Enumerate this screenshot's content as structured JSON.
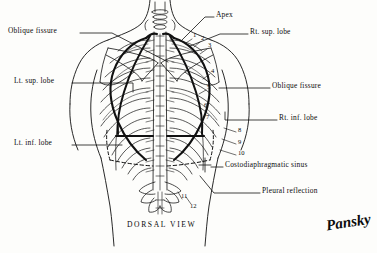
{
  "figure": {
    "caption": "DORSAL VIEW",
    "signature": "Pansky",
    "ink_color": "#0b0b0b",
    "background_color": "#fdfdfb"
  },
  "labels_left": [
    {
      "text": "Oblique fissure",
      "x": 8,
      "y": 30,
      "leader_to_x": 168,
      "leader_to_y": 62
    },
    {
      "text": "Lt. sup. lobe",
      "x": 14,
      "y": 80,
      "leader_to_x": 133,
      "leader_to_y": 88
    },
    {
      "text": "Lt. inf. lobe",
      "x": 14,
      "y": 142,
      "leader_to_x": 122,
      "leader_to_y": 146
    }
  ],
  "labels_right": [
    {
      "text": "Apex",
      "x": 216,
      "y": 14,
      "leader_to_x": 182,
      "leader_to_y": 40
    },
    {
      "text": "Rt. sup. lobe",
      "x": 250,
      "y": 31,
      "leader_to_x": 199,
      "leader_to_y": 46
    },
    {
      "text": "Oblique fissure",
      "x": 272,
      "y": 85,
      "leader_to_x": 219,
      "leader_to_y": 88
    },
    {
      "text": "Rt. inf. lobe",
      "x": 279,
      "y": 117,
      "leader_to_x": 224,
      "leader_to_y": 121
    },
    {
      "text": "Costodiaphragmatic sinus",
      "x": 225,
      "y": 164,
      "leader_to_x": 213,
      "leader_to_y": 165
    },
    {
      "text": "Pleural reflection",
      "x": 262,
      "y": 190,
      "leader_to_x": 205,
      "leader_to_y": 178
    }
  ],
  "rib_numbers": [
    {
      "n": "1",
      "x": 193,
      "y": 35
    },
    {
      "n": "2",
      "x": 201,
      "y": 38
    },
    {
      "n": "3",
      "x": 208,
      "y": 45
    },
    {
      "n": "4",
      "x": 211,
      "y": 71
    },
    {
      "n": "5",
      "x": 207,
      "y": 87
    },
    {
      "n": "6",
      "x": 204,
      "y": 105
    },
    {
      "n": "7",
      "x": 206,
      "y": 117
    },
    {
      "n": "8",
      "x": 238,
      "y": 130
    },
    {
      "n": "9",
      "x": 238,
      "y": 142
    },
    {
      "n": "10",
      "x": 238,
      "y": 153
    },
    {
      "n": "11",
      "x": 181,
      "y": 196
    },
    {
      "n": "12",
      "x": 190,
      "y": 206
    }
  ],
  "anatomy": {
    "view": "dorsal",
    "structures": [
      "body outline",
      "scapula left",
      "scapula right",
      "vertebral column",
      "ribs 1-12",
      "lung border",
      "pleural reflection",
      "oblique fissure",
      "costodiaphragmatic sinus"
    ]
  }
}
